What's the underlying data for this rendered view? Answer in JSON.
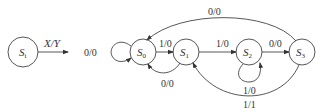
{
  "diagram": {
    "type": "state-diagram",
    "legend": {
      "state": {
        "name": "S",
        "sub": "i"
      },
      "edge_label": "X/Y"
    },
    "states": [
      {
        "id": "S0",
        "name": "S",
        "sub": "0"
      },
      {
        "id": "S1",
        "name": "S",
        "sub": "1"
      },
      {
        "id": "S2",
        "name": "S",
        "sub": "2"
      },
      {
        "id": "S3",
        "name": "S",
        "sub": "3"
      }
    ],
    "transitions": [
      {
        "from": "S0",
        "to": "S0",
        "label": "0/0"
      },
      {
        "from": "S0",
        "to": "S1",
        "label": "1/0"
      },
      {
        "from": "S1",
        "to": "S0",
        "label": "0/0"
      },
      {
        "from": "S1",
        "to": "S2",
        "label": "1/0"
      },
      {
        "from": "S2",
        "to": "S2",
        "label": "1/0"
      },
      {
        "from": "S2",
        "to": "S3",
        "label": "0/0"
      },
      {
        "from": "S3",
        "to": "S0",
        "label": "0/0"
      },
      {
        "from": "S3",
        "to": "S1",
        "label": "1/1"
      }
    ]
  }
}
